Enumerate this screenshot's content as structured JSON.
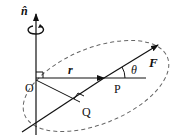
{
  "diagram": {
    "labels": {
      "axis": "n̂",
      "origin": "O",
      "position_vector": "r",
      "point_p": "P",
      "point_q": "Q",
      "angle": "θ",
      "force": "F"
    },
    "colors": {
      "stroke": "#111111",
      "dashed_ellipse": "#666666",
      "background": "#ffffff"
    }
  }
}
